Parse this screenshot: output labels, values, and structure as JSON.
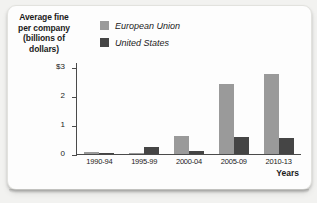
{
  "chart_data": {
    "type": "bar",
    "title": "Average fine per company (billions of dollars)",
    "title_lines": [
      "Average fine",
      "per company",
      "(billions of",
      "dollars)"
    ],
    "xlabel": "Years",
    "ylabel": "Average fine per company (billions of dollars)",
    "categories": [
      "1990-94",
      "1995-99",
      "2000-04",
      "2005-09",
      "2010-13"
    ],
    "series": [
      {
        "name": "European Union",
        "color": "#9a9a9a",
        "values": [
          0.06,
          0.02,
          0.65,
          2.45,
          2.8
        ]
      },
      {
        "name": "United States",
        "color": "#454545",
        "values": [
          0.01,
          0.25,
          0.12,
          0.6,
          0.55
        ]
      }
    ],
    "ylim": [
      0,
      3.2
    ],
    "ytick_values": [
      3,
      2,
      1,
      0
    ],
    "ytick_labels": [
      "$3",
      "2",
      "1",
      "0"
    ],
    "grid": false,
    "legend_position": "top-center"
  },
  "legend": {
    "items": [
      {
        "label": "European Union",
        "color": "#9a9a9a"
      },
      {
        "label": "United States",
        "color": "#454545"
      }
    ]
  }
}
